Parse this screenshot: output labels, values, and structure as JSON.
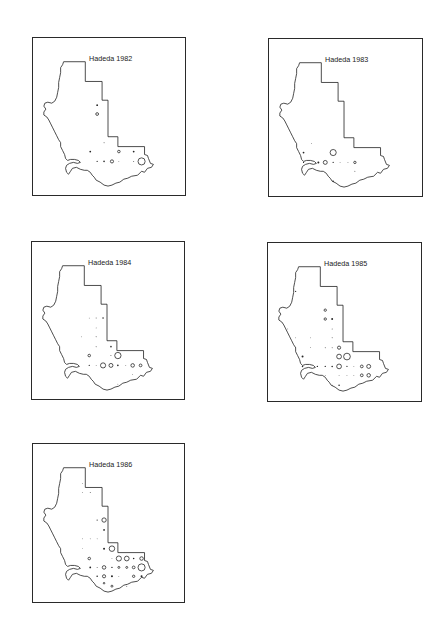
{
  "figure": {
    "panels": [
      {
        "title": "Hadeda 1982",
        "box": {
          "left": 32,
          "top": 37,
          "width": 154,
          "height": 159
        },
        "points": [
          {
            "x": 65,
            "y": 68,
            "r": 0.9,
            "solid": true
          },
          {
            "x": 65,
            "y": 77,
            "r": 1.4,
            "solid": false
          },
          {
            "x": 72,
            "y": 106,
            "r": 0.5,
            "solid": true
          },
          {
            "x": 58,
            "y": 115,
            "r": 0.9,
            "solid": true
          },
          {
            "x": 87,
            "y": 115,
            "r": 1.3,
            "solid": false
          },
          {
            "x": 102,
            "y": 115,
            "r": 0.9,
            "solid": true
          },
          {
            "x": 65,
            "y": 125,
            "r": 0.6,
            "solid": true
          },
          {
            "x": 72,
            "y": 125,
            "r": 0.8,
            "solid": true
          },
          {
            "x": 80,
            "y": 125,
            "r": 1.6,
            "solid": false
          },
          {
            "x": 87,
            "y": 125,
            "r": 0.4,
            "solid": true
          },
          {
            "x": 102,
            "y": 125,
            "r": 0.5,
            "solid": true
          },
          {
            "x": 110,
            "y": 125,
            "r": 3.6,
            "solid": false
          }
        ]
      },
      {
        "title": "Hadeda 1983",
        "box": {
          "left": 268,
          "top": 38,
          "width": 155,
          "height": 159
        },
        "points": [
          {
            "x": 43,
            "y": 106,
            "r": 0.4,
            "solid": true
          },
          {
            "x": 35,
            "y": 115,
            "r": 0.9,
            "solid": true
          },
          {
            "x": 65,
            "y": 115,
            "r": 3.1,
            "solid": false
          },
          {
            "x": 50,
            "y": 125,
            "r": 1.0,
            "solid": true
          },
          {
            "x": 57,
            "y": 125,
            "r": 2.0,
            "solid": false
          },
          {
            "x": 65,
            "y": 125,
            "r": 0.6,
            "solid": true
          },
          {
            "x": 72,
            "y": 125,
            "r": 0.4,
            "solid": true
          },
          {
            "x": 80,
            "y": 125,
            "r": 0.4,
            "solid": true
          },
          {
            "x": 87,
            "y": 125,
            "r": 1.2,
            "solid": false
          },
          {
            "x": 35,
            "y": 125,
            "r": 0.6,
            "solid": true
          },
          {
            "x": 65,
            "y": 144,
            "r": 0.8,
            "solid": true
          },
          {
            "x": 87,
            "y": 134,
            "r": 0.5,
            "solid": true
          }
        ]
      },
      {
        "title": "Hadeda 1984",
        "box": {
          "left": 31,
          "top": 241,
          "width": 154,
          "height": 159
        },
        "points": [
          {
            "x": 58,
            "y": 77,
            "r": 0.4,
            "solid": true
          },
          {
            "x": 65,
            "y": 77,
            "r": 0.5,
            "solid": true
          },
          {
            "x": 72,
            "y": 77,
            "r": 0.8,
            "solid": true
          },
          {
            "x": 65,
            "y": 87,
            "r": 0.4,
            "solid": true
          },
          {
            "x": 50,
            "y": 96,
            "r": 0.4,
            "solid": true
          },
          {
            "x": 65,
            "y": 96,
            "r": 0.5,
            "solid": true
          },
          {
            "x": 65,
            "y": 106,
            "r": 0.5,
            "solid": true
          },
          {
            "x": 80,
            "y": 106,
            "r": 0.8,
            "solid": true
          },
          {
            "x": 58,
            "y": 115,
            "r": 1.3,
            "solid": false
          },
          {
            "x": 80,
            "y": 115,
            "r": 0.5,
            "solid": true
          },
          {
            "x": 87,
            "y": 115,
            "r": 3.2,
            "solid": false
          },
          {
            "x": 65,
            "y": 125,
            "r": 0.4,
            "solid": true
          },
          {
            "x": 72,
            "y": 125,
            "r": 2.6,
            "solid": false
          },
          {
            "x": 80,
            "y": 125,
            "r": 2.0,
            "solid": false
          },
          {
            "x": 87,
            "y": 125,
            "r": 0.8,
            "solid": true
          },
          {
            "x": 95,
            "y": 125,
            "r": 0.4,
            "solid": true
          },
          {
            "x": 102,
            "y": 125,
            "r": 1.8,
            "solid": false
          },
          {
            "x": 110,
            "y": 125,
            "r": 1.4,
            "solid": false
          },
          {
            "x": 58,
            "y": 125,
            "r": 0.6,
            "solid": true
          },
          {
            "x": 102,
            "y": 134,
            "r": 0.4,
            "solid": true
          },
          {
            "x": 87,
            "y": 144,
            "r": 0.4,
            "solid": true
          }
        ]
      },
      {
        "title": "Hadeda 1985",
        "box": {
          "left": 267,
          "top": 242,
          "width": 155,
          "height": 160
        },
        "points": [
          {
            "x": 28,
            "y": 49,
            "r": 0.6,
            "solid": true
          },
          {
            "x": 58,
            "y": 68,
            "r": 1.2,
            "solid": false
          },
          {
            "x": 58,
            "y": 77,
            "r": 1.2,
            "solid": false
          },
          {
            "x": 65,
            "y": 77,
            "r": 1.0,
            "solid": true
          },
          {
            "x": 20,
            "y": 87,
            "r": 0.4,
            "solid": true
          },
          {
            "x": 65,
            "y": 87,
            "r": 0.5,
            "solid": true
          },
          {
            "x": 28,
            "y": 96,
            "r": 0.4,
            "solid": true
          },
          {
            "x": 43,
            "y": 96,
            "r": 0.4,
            "solid": true
          },
          {
            "x": 65,
            "y": 96,
            "r": 0.5,
            "solid": true
          },
          {
            "x": 28,
            "y": 106,
            "r": 0.4,
            "solid": true
          },
          {
            "x": 43,
            "y": 106,
            "r": 0.4,
            "solid": true
          },
          {
            "x": 58,
            "y": 106,
            "r": 0.5,
            "solid": true
          },
          {
            "x": 65,
            "y": 106,
            "r": 0.5,
            "solid": true
          },
          {
            "x": 72,
            "y": 106,
            "r": 1.6,
            "solid": false
          },
          {
            "x": 35,
            "y": 115,
            "r": 1.0,
            "solid": true
          },
          {
            "x": 72,
            "y": 115,
            "r": 2.4,
            "solid": false
          },
          {
            "x": 80,
            "y": 115,
            "r": 3.4,
            "solid": false
          },
          {
            "x": 50,
            "y": 125,
            "r": 0.7,
            "solid": true
          },
          {
            "x": 58,
            "y": 125,
            "r": 0.7,
            "solid": true
          },
          {
            "x": 65,
            "y": 125,
            "r": 0.8,
            "solid": true
          },
          {
            "x": 72,
            "y": 125,
            "r": 2.4,
            "solid": false
          },
          {
            "x": 80,
            "y": 125,
            "r": 0.6,
            "solid": true
          },
          {
            "x": 87,
            "y": 125,
            "r": 0.4,
            "solid": true
          },
          {
            "x": 95,
            "y": 125,
            "r": 1.4,
            "solid": false
          },
          {
            "x": 102,
            "y": 125,
            "r": 2.0,
            "solid": false
          },
          {
            "x": 35,
            "y": 125,
            "r": 0.8,
            "solid": true
          },
          {
            "x": 58,
            "y": 134,
            "r": 0.4,
            "solid": true
          },
          {
            "x": 72,
            "y": 134,
            "r": 0.4,
            "solid": true
          },
          {
            "x": 80,
            "y": 134,
            "r": 0.4,
            "solid": true
          },
          {
            "x": 87,
            "y": 134,
            "r": 0.4,
            "solid": true
          },
          {
            "x": 95,
            "y": 134,
            "r": 1.4,
            "solid": false
          },
          {
            "x": 102,
            "y": 134,
            "r": 1.8,
            "solid": false
          },
          {
            "x": 65,
            "y": 144,
            "r": 0.5,
            "solid": true
          },
          {
            "x": 72,
            "y": 144,
            "r": 0.8,
            "solid": true
          }
        ]
      },
      {
        "title": "Hadeda 1986",
        "box": {
          "left": 32,
          "top": 443,
          "width": 153,
          "height": 160
        },
        "points": [
          {
            "x": 50,
            "y": 40,
            "r": 0.4,
            "solid": true
          },
          {
            "x": 50,
            "y": 49,
            "r": 0.4,
            "solid": true
          },
          {
            "x": 58,
            "y": 49,
            "r": 0.5,
            "solid": true
          },
          {
            "x": 65,
            "y": 77,
            "r": 0.6,
            "solid": true
          },
          {
            "x": 72,
            "y": 77,
            "r": 2.2,
            "solid": false
          },
          {
            "x": 72,
            "y": 87,
            "r": 0.9,
            "solid": true
          },
          {
            "x": 50,
            "y": 96,
            "r": 0.4,
            "solid": true
          },
          {
            "x": 58,
            "y": 96,
            "r": 0.4,
            "solid": true
          },
          {
            "x": 65,
            "y": 96,
            "r": 0.4,
            "solid": true
          },
          {
            "x": 50,
            "y": 106,
            "r": 0.3,
            "solid": true
          },
          {
            "x": 72,
            "y": 106,
            "r": 1.0,
            "solid": true
          },
          {
            "x": 80,
            "y": 106,
            "r": 2.8,
            "solid": false
          },
          {
            "x": 57,
            "y": 116,
            "r": 1.3,
            "solid": false
          },
          {
            "x": 80,
            "y": 116,
            "r": 0.4,
            "solid": true
          },
          {
            "x": 87,
            "y": 116,
            "r": 2.6,
            "solid": false
          },
          {
            "x": 95,
            "y": 116,
            "r": 2.4,
            "solid": false
          },
          {
            "x": 102,
            "y": 116,
            "r": 0.8,
            "solid": true
          },
          {
            "x": 110,
            "y": 116,
            "r": 1.8,
            "solid": false
          },
          {
            "x": 58,
            "y": 125,
            "r": 0.9,
            "solid": true
          },
          {
            "x": 65,
            "y": 125,
            "r": 0.5,
            "solid": true
          },
          {
            "x": 72,
            "y": 125,
            "r": 1.8,
            "solid": false
          },
          {
            "x": 80,
            "y": 125,
            "r": 0.7,
            "solid": true
          },
          {
            "x": 87,
            "y": 125,
            "r": 1.0,
            "solid": false
          },
          {
            "x": 95,
            "y": 125,
            "r": 1.0,
            "solid": false
          },
          {
            "x": 102,
            "y": 125,
            "r": 1.4,
            "solid": false
          },
          {
            "x": 110,
            "y": 125,
            "r": 3.6,
            "solid": false
          },
          {
            "x": 65,
            "y": 134,
            "r": 0.8,
            "solid": true
          },
          {
            "x": 72,
            "y": 134,
            "r": 1.6,
            "solid": false
          },
          {
            "x": 80,
            "y": 134,
            "r": 1.0,
            "solid": true
          },
          {
            "x": 87,
            "y": 134,
            "r": 0.4,
            "solid": true
          },
          {
            "x": 102,
            "y": 134,
            "r": 1.2,
            "solid": false
          },
          {
            "x": 110,
            "y": 134,
            "r": 1.0,
            "solid": true
          },
          {
            "x": 80,
            "y": 144,
            "r": 1.0,
            "solid": false
          },
          {
            "x": 95,
            "y": 144,
            "r": 0.5,
            "solid": true
          },
          {
            "x": 72,
            "y": 141,
            "r": 0.8,
            "solid": false
          }
        ]
      }
    ],
    "outline_path": "M31,24 L53,24 L53,44 L70,44 L70,63 L76,63 L76,100 L86,100 L86,110 L113,110 L113,118 L116,119 L117,122 L119,127 L122,128 L120,131 L116,132 L113,136 L110,135 L106,139 L100,140 L96,142 L92,143 L88,146 L84,147 L80,149 L76,150 L72,149 L68,146 L64,144 L62,141 L60,139 L58,136 L55,134 L52,134 L48,133 L44,131 L40,132 L38,135 L36,138 L34,136 L33,132 L34,129 L37,127 L41,126 L45,127 L48,126 L46,124 L42,123 L38,123 L35,124 L33,122 L32,118 L30,114 L28,110 L28,106 L26,103 L24,99 L22,95 L20,91 L18,87 L16,83 L14,80 L11,78 L11,75 L13,72 L11,69 L12,66 L15,65 L19,66 L22,64 L24,60 L25,55 L26,50 L26,45 L27,40 L28,35 L28,30 L30,27 Z",
    "title_offset": {
      "x": 56,
      "y": 20
    }
  }
}
